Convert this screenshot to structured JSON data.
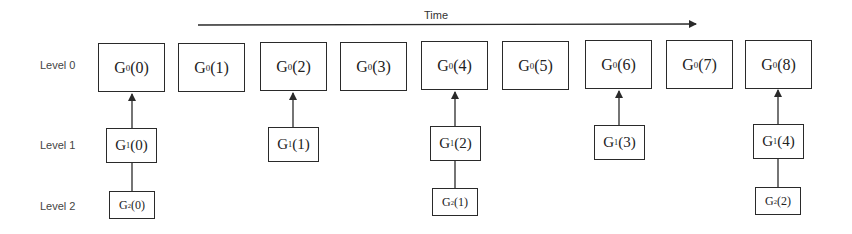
{
  "time_axis": {
    "label": "Time",
    "direction": "left-to-right"
  },
  "levels": [
    {
      "label": "Level 0"
    },
    {
      "label": "Level 1"
    },
    {
      "label": "Level 2"
    }
  ],
  "nodes": {
    "level0": [
      {
        "name": "G",
        "sub": "0",
        "index": "(0)"
      },
      {
        "name": "G",
        "sub": "0",
        "index": "(1)"
      },
      {
        "name": "G",
        "sub": "0",
        "index": "(2)"
      },
      {
        "name": "G",
        "sub": "0",
        "index": "(3)"
      },
      {
        "name": "G",
        "sub": "0",
        "index": "(4)"
      },
      {
        "name": "G",
        "sub": "0",
        "index": "(5)"
      },
      {
        "name": "G",
        "sub": "0",
        "index": "(6)"
      },
      {
        "name": "G",
        "sub": "0",
        "index": "(7)"
      },
      {
        "name": "G",
        "sub": "0",
        "index": "(8)"
      }
    ],
    "level1": [
      {
        "name": "G",
        "sub": "1",
        "index": "(0)",
        "parent": "G0(0)"
      },
      {
        "name": "G",
        "sub": "1",
        "index": "(1)",
        "parent": "G0(2)"
      },
      {
        "name": "G",
        "sub": "1",
        "index": "(2)",
        "parent": "G0(4)"
      },
      {
        "name": "G",
        "sub": "1",
        "index": "(3)",
        "parent": "G0(6)"
      },
      {
        "name": "G",
        "sub": "1",
        "index": "(4)",
        "parent": "G0(8)"
      }
    ],
    "level2": [
      {
        "name": "G",
        "sub": "2",
        "index": "(0)",
        "parent": "G1(0)"
      },
      {
        "name": "G",
        "sub": "2",
        "index": "(1)",
        "parent": "G1(2)"
      },
      {
        "name": "G",
        "sub": "2",
        "index": "(2)",
        "parent": "G1(4)"
      }
    ]
  },
  "colors": {
    "stroke": "#2a2a2a",
    "text": "#222222",
    "label": "#444444"
  }
}
